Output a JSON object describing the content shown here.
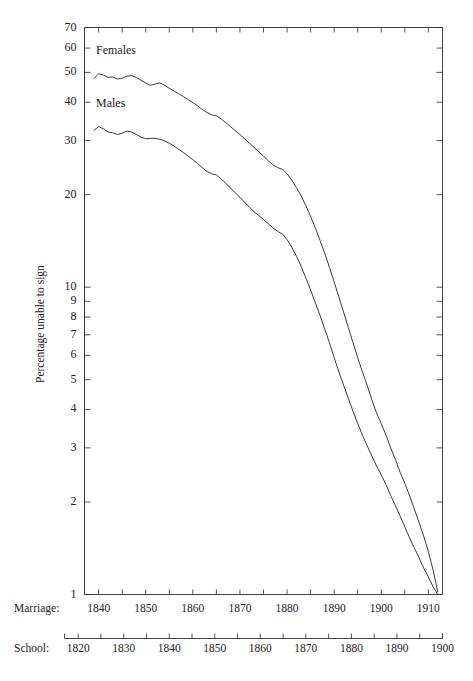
{
  "figure": {
    "background": "#ffffff",
    "ink_color": "#3a3a3a",
    "series_labels": {
      "females": "Females",
      "males": "Males"
    },
    "axis_titles": {
      "y": "Percentage unable to sign",
      "x_marriage": "Marriage:",
      "x_school": "School:"
    }
  },
  "chart_data": {
    "type": "line",
    "title": "",
    "xlabel": "Marriage:",
    "ylabel": "Percentage unable to sign",
    "yscale": "log",
    "ylim": [
      1,
      70
    ],
    "xlim": [
      1837,
      1913
    ],
    "grid": false,
    "legend": "inline-labels",
    "y_ticks": [
      1,
      2,
      3,
      4,
      5,
      6,
      7,
      8,
      9,
      10,
      20,
      30,
      40,
      50,
      60,
      70
    ],
    "y_tick_labels": [
      "1",
      "2",
      "3",
      "4",
      "5",
      "6",
      "7",
      "8",
      "9",
      "10",
      "20",
      "30",
      "40",
      "50",
      "60",
      "70"
    ],
    "x_axes": [
      {
        "name": "Marriage:",
        "ticks": [
          1840,
          1850,
          1860,
          1870,
          1880,
          1890,
          1900,
          1910
        ],
        "tick_labels": [
          "1840",
          "1850",
          "1860",
          "1870",
          "1880",
          "1890",
          "1900",
          "1910"
        ],
        "minor_tick_step": 5,
        "range": [
          1837,
          1913
        ]
      },
      {
        "name": "School:",
        "ticks": [
          1820,
          1830,
          1840,
          1850,
          1860,
          1870,
          1880,
          1890,
          1900
        ],
        "tick_labels": [
          "1820",
          "1830",
          "1840",
          "1850",
          "1860",
          "1870",
          "1880",
          "1890",
          "1900"
        ],
        "minor_tick_step": 5,
        "range": [
          1817,
          1900
        ]
      }
    ],
    "x": [
      1839,
      1840,
      1841,
      1842,
      1843,
      1844,
      1845,
      1846,
      1847,
      1848,
      1849,
      1850,
      1851,
      1852,
      1853,
      1854,
      1855,
      1856,
      1857,
      1858,
      1859,
      1860,
      1861,
      1862,
      1863,
      1864,
      1865,
      1866,
      1867,
      1868,
      1869,
      1870,
      1871,
      1872,
      1873,
      1874,
      1875,
      1876,
      1877,
      1878,
      1879,
      1880,
      1881,
      1882,
      1883,
      1884,
      1885,
      1886,
      1887,
      1888,
      1889,
      1890,
      1891,
      1892,
      1893,
      1894,
      1895,
      1896,
      1897,
      1898,
      1899,
      1900,
      1901,
      1902,
      1903,
      1904,
      1905,
      1906,
      1907,
      1908,
      1909,
      1910,
      1911,
      1912
    ],
    "series": [
      {
        "name": "Females",
        "values": [
          47.8,
          49.5,
          49.0,
          48.2,
          48.3,
          47.6,
          47.9,
          48.6,
          48.8,
          48.2,
          47.1,
          46.2,
          45.4,
          45.8,
          46.2,
          45.4,
          44.4,
          43.5,
          42.6,
          41.7,
          40.8,
          39.9,
          38.9,
          37.9,
          37.0,
          36.4,
          36.1,
          35.3,
          34.3,
          33.3,
          32.3,
          31.4,
          30.4,
          29.4,
          28.5,
          27.6,
          26.7,
          25.8,
          25.0,
          24.5,
          24.2,
          23.4,
          22.3,
          21.1,
          19.8,
          18.4,
          17.0,
          15.6,
          14.2,
          12.9,
          11.6,
          10.4,
          9.3,
          8.3,
          7.4,
          6.6,
          5.9,
          5.3,
          4.8,
          4.3,
          3.9,
          3.6,
          3.3,
          3.0,
          2.75,
          2.5,
          2.3,
          2.1,
          1.9,
          1.72,
          1.55,
          1.38,
          1.2,
          1.02
        ]
      },
      {
        "name": "Males",
        "values": [
          32.4,
          33.3,
          32.8,
          32.0,
          31.8,
          31.4,
          31.7,
          32.2,
          32.0,
          31.4,
          30.8,
          30.4,
          30.5,
          30.5,
          30.3,
          29.9,
          29.4,
          28.8,
          28.1,
          27.4,
          26.7,
          26.0,
          25.3,
          24.5,
          23.8,
          23.4,
          23.2,
          22.5,
          21.8,
          21.0,
          20.3,
          19.6,
          18.9,
          18.2,
          17.6,
          17.1,
          16.6,
          16.1,
          15.6,
          15.2,
          14.9,
          14.3,
          13.5,
          12.6,
          11.7,
          10.7,
          9.8,
          8.9,
          8.1,
          7.3,
          6.6,
          5.9,
          5.3,
          4.8,
          4.35,
          3.95,
          3.6,
          3.3,
          3.05,
          2.82,
          2.62,
          2.45,
          2.28,
          2.1,
          1.95,
          1.8,
          1.66,
          1.53,
          1.42,
          1.32,
          1.22,
          1.14,
          1.06,
          1.0
        ]
      }
    ]
  }
}
